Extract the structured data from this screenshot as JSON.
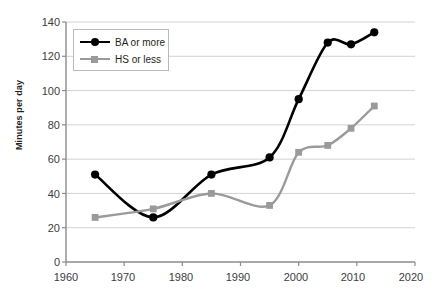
{
  "chart_data": {
    "type": "line",
    "title": "",
    "subtitle": "",
    "xlabel": "",
    "ylabel": "Minutes per day",
    "xlim": [
      1960,
      2020
    ],
    "ylim": [
      0,
      140
    ],
    "xticks": [
      1960,
      1970,
      1980,
      1990,
      2000,
      2010,
      2020
    ],
    "yticks": [
      0,
      20,
      40,
      60,
      80,
      100,
      120,
      140
    ],
    "grid": "horizontal",
    "legend_position": "top-left",
    "series": [
      {
        "name": "BA or more",
        "color": "#000000",
        "marker": "circle",
        "x": [
          1965,
          1975,
          1985,
          1995,
          2000,
          2005,
          2009,
          2013
        ],
        "values": [
          51,
          26,
          51,
          61,
          95,
          128,
          127,
          134
        ]
      },
      {
        "name": "HS or less",
        "color": "#9a9a9a",
        "marker": "square",
        "x": [
          1965,
          1975,
          1985,
          1995,
          2000,
          2005,
          2009,
          2013
        ],
        "values": [
          26,
          31,
          40,
          33,
          64,
          68,
          78,
          91
        ]
      }
    ]
  },
  "axes": {
    "y_tick_labels": [
      "140",
      "120",
      "100",
      "80",
      "60",
      "40",
      "20",
      "0"
    ],
    "x_tick_labels": [
      "1960",
      "1970",
      "1980",
      "1990",
      "2000",
      "2010",
      "2020"
    ],
    "y_axis_title": "Minutes per day"
  },
  "legend": {
    "items": [
      {
        "label": "BA or more"
      },
      {
        "label": "HS or less"
      }
    ]
  },
  "colors": {
    "series_ba": "#000000",
    "series_hs": "#9a9a9a",
    "grid": "#d3d3d3",
    "axis": "#808080",
    "text": "#3c3c3c"
  }
}
